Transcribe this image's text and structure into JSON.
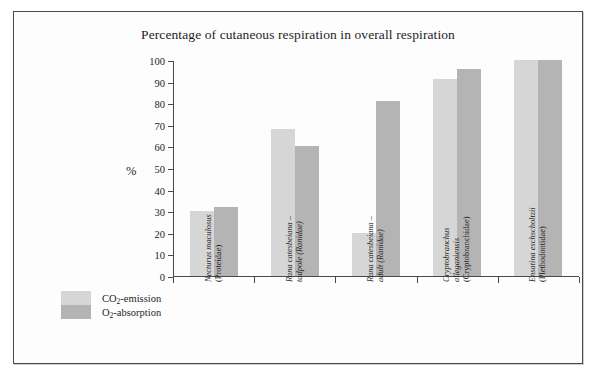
{
  "figure": {
    "background_color": "#ffffff",
    "frame_border_color": "#4a4a4a"
  },
  "chart_data": {
    "type": "bar",
    "title": "Percentage of cutaneous respiration in overall respiration",
    "xlabel": "",
    "ylabel": "%",
    "ylim": [
      0,
      100
    ],
    "ytick_step": 10,
    "yticks": [
      0,
      10,
      20,
      30,
      40,
      50,
      60,
      70,
      80,
      90,
      100
    ],
    "grid": false,
    "legend_position": "bottom-left",
    "categories": [
      "Necturus maculosus (Proteidae)",
      "Rana catesbeiana – tadpole (Ranidae)",
      "Rana catesbeiana – adult (Ranidae)",
      "Cryptobranchus alleganiensis (Cryptobranchidae)",
      "Ensatina eschscholtzii (Plethodontidae)"
    ],
    "category_lines": [
      [
        "Necturus maculosus",
        "(Proteidae)"
      ],
      [
        "Rana catesbeiana –",
        "tadpole (Ranidae)"
      ],
      [
        "Rana catesbeiana –",
        "adult (Ranidae)"
      ],
      [
        "Cryptobranchus",
        "alleganiensis",
        "(Cryptobranchidae)"
      ],
      [
        "Ensatina eschscholtzii",
        "(Plethodontidae)"
      ]
    ],
    "category_species": [
      "Necturus maculosus",
      "Rana catesbeiana",
      "Rana catesbeiana",
      "Cryptobranchus alleganiensis",
      "Ensatina eschscholtzii"
    ],
    "series": [
      {
        "name": "CO2-emission",
        "color": "#d6d6d6",
        "values": [
          30,
          68,
          20,
          91,
          100
        ]
      },
      {
        "name": "O2-absorption",
        "color": "#b4b4b4",
        "values": [
          32,
          60,
          81,
          96,
          100
        ]
      }
    ]
  },
  "legend": {
    "items": [
      {
        "label_main": "CO",
        "label_sub": "2",
        "label_rest": "-emission",
        "color": "#d6d6d6"
      },
      {
        "label_main": "O",
        "label_sub": "2",
        "label_rest": "-absorption",
        "color": "#b4b4b4"
      }
    ]
  },
  "axis": {
    "y_title": "%",
    "tick_labels": [
      "0",
      "10",
      "20",
      "30",
      "40",
      "50",
      "60",
      "70",
      "80",
      "90",
      "100"
    ]
  }
}
